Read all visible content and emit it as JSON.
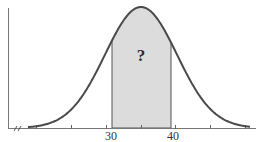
{
  "chart_data": {
    "type": "area",
    "title": "",
    "xlabel": "",
    "ylabel": "",
    "distribution": "normal",
    "shaded_interval": [
      30,
      40
    ],
    "shaded_label": "?",
    "tick_labels": [
      "30",
      "40"
    ],
    "axis_break": true,
    "grid": false,
    "legend": null
  },
  "colors": {
    "curve": "#4a4a4a",
    "shade": "#dcdcdc",
    "axis": "#666666"
  },
  "labels": {
    "tick_30": "30",
    "tick_40": "40",
    "question": "?"
  }
}
